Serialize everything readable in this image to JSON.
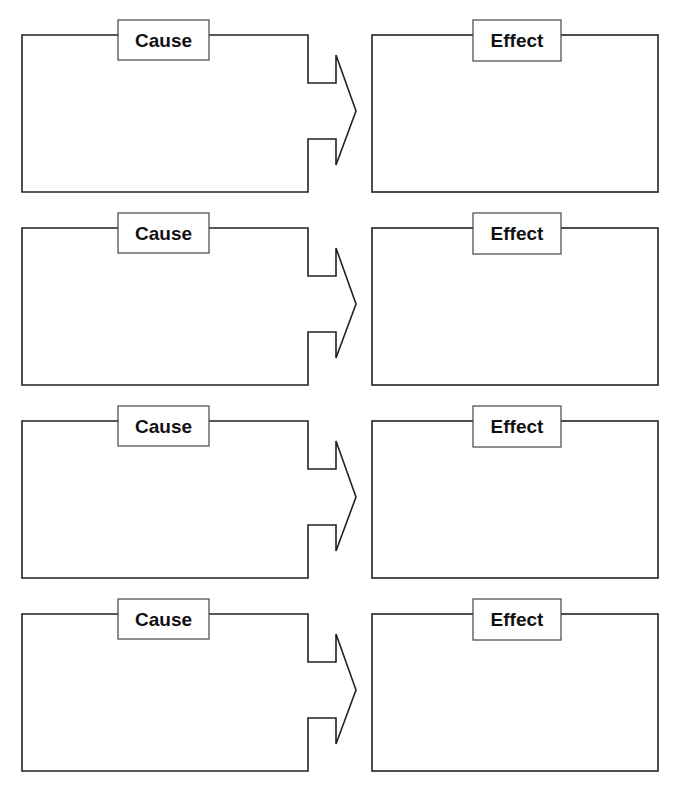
{
  "colors": {
    "line": "#222222",
    "background": "#ffffff",
    "text": "#111111"
  },
  "pairs": [
    {
      "cause": {
        "label": "Cause",
        "text": ""
      },
      "effect": {
        "label": "Effect",
        "text": ""
      }
    },
    {
      "cause": {
        "label": "Cause",
        "text": ""
      },
      "effect": {
        "label": "Effect",
        "text": ""
      }
    },
    {
      "cause": {
        "label": "Cause",
        "text": ""
      },
      "effect": {
        "label": "Effect",
        "text": ""
      }
    },
    {
      "cause": {
        "label": "Cause",
        "text": ""
      },
      "effect": {
        "label": "Effect",
        "text": ""
      }
    }
  ]
}
